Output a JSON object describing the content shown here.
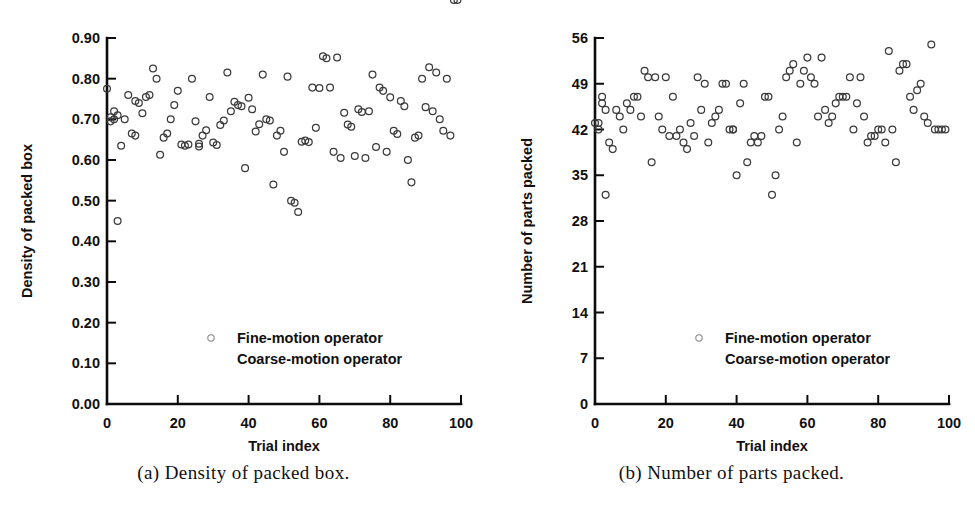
{
  "figure": {
    "background": "#ffffff",
    "marker_color": "#3b3b3b",
    "axis_color": "#0c0c0c"
  },
  "panels": [
    {
      "id": "a",
      "caption": "(a) Density of packed box.",
      "legend": {
        "entries": [
          {
            "label": "Fine-motion operator",
            "marker": "open-circle"
          },
          {
            "label": "Coarse-motion operator",
            "marker": "none"
          }
        ]
      },
      "chart_data": {
        "type": "scatter",
        "title": "",
        "xlabel": "Trial index",
        "ylabel": "Density of packed box",
        "xlim": [
          0,
          100
        ],
        "ylim": [
          0,
          0.9
        ],
        "xticks": [
          0,
          20,
          40,
          60,
          80,
          100
        ],
        "xticklabels": [
          "0",
          "20",
          "40",
          "60",
          "80",
          "100"
        ],
        "yticks": [
          0.0,
          0.1,
          0.2,
          0.3,
          0.4,
          0.5,
          0.6,
          0.7,
          0.8,
          0.9
        ],
        "yticklabels": [
          "0.00",
          "0.10",
          "0.20",
          "0.30",
          "0.40",
          "0.50",
          "0.60",
          "0.70",
          "0.80",
          "0.90"
        ],
        "grid": false,
        "legend_position": "lower-center",
        "series": [
          {
            "name": "Fine-motion operator",
            "marker": "open-circle",
            "x": [
              0,
              1,
              1,
              2,
              2,
              3,
              3,
              4,
              5,
              6,
              7,
              8,
              8,
              9,
              10,
              11,
              12,
              13,
              14,
              15,
              16,
              17,
              18,
              19,
              20,
              21,
              22,
              23,
              24,
              25,
              26,
              26,
              27,
              28,
              29,
              30,
              31,
              32,
              33,
              34,
              35,
              36,
              37,
              38,
              39,
              40,
              41,
              42,
              43,
              44,
              45,
              46,
              47,
              48,
              49,
              50,
              51,
              52,
              53,
              54,
              55,
              56,
              57,
              58,
              59,
              60,
              61,
              62,
              63,
              64,
              65,
              66,
              67,
              68,
              69,
              70,
              71,
              72,
              73,
              74,
              75,
              76,
              77,
              78,
              79,
              80,
              81,
              82,
              83,
              84,
              85,
              86,
              87,
              88,
              89,
              90,
              91,
              92,
              93,
              94,
              95,
              96,
              97,
              98,
              99
            ],
            "y": [
              0.775,
              0.705,
              0.695,
              0.72,
              0.7,
              0.71,
              0.45,
              0.635,
              0.7,
              0.76,
              0.665,
              0.66,
              0.745,
              0.74,
              0.715,
              0.755,
              0.76,
              0.825,
              0.8,
              0.613,
              0.655,
              0.665,
              0.7,
              0.735,
              0.77,
              0.638,
              0.635,
              0.638,
              0.8,
              0.695,
              0.633,
              0.64,
              0.66,
              0.673,
              0.755,
              0.643,
              0.637,
              0.686,
              0.697,
              0.815,
              0.72,
              0.743,
              0.735,
              0.732,
              0.58,
              0.753,
              0.725,
              0.67,
              0.688,
              0.81,
              0.7,
              0.697,
              0.54,
              0.66,
              0.672,
              0.62,
              0.805,
              0.5,
              0.495,
              0.472,
              0.645,
              0.648,
              0.644,
              0.778,
              0.679,
              0.777,
              0.855,
              0.85,
              0.778,
              0.62,
              0.852,
              0.605,
              0.716,
              0.687,
              0.682,
              0.61,
              0.725,
              0.718,
              0.605,
              0.72,
              0.81,
              0.632,
              0.778,
              0.77,
              0.62,
              0.754,
              0.672,
              0.664,
              0.745,
              0.732,
              0.6,
              0.545,
              0.655,
              0.66,
              0.8,
              0.73,
              0.828,
              0.72,
              0.815,
              0.7,
              0.672,
              0.8,
              0.66
            ]
          }
        ]
      }
    },
    {
      "id": "b",
      "caption": "(b) Number of parts packed.",
      "legend": {
        "entries": [
          {
            "label": "Fine-motion operator",
            "marker": "open-circle"
          },
          {
            "label": "Coarse-motion operator",
            "marker": "none"
          }
        ]
      },
      "chart_data": {
        "type": "scatter",
        "title": "",
        "xlabel": "Trial index",
        "ylabel": "Number of parts packed",
        "xlim": [
          0,
          100
        ],
        "ylim": [
          0,
          56
        ],
        "xticks": [
          0,
          20,
          40,
          60,
          80,
          100
        ],
        "xticklabels": [
          "0",
          "20",
          "40",
          "60",
          "80",
          "100"
        ],
        "yticks": [
          0,
          7,
          14,
          21,
          28,
          35,
          42,
          49,
          56
        ],
        "yticklabels": [
          "0",
          "7",
          "14",
          "21",
          "28",
          "35",
          "42",
          "49",
          "56"
        ],
        "grid": false,
        "legend_position": "lower-center",
        "series": [
          {
            "name": "Fine-motion operator",
            "marker": "open-circle",
            "x": [
              0,
              1,
              1,
              2,
              2,
              3,
              3,
              4,
              5,
              6,
              7,
              8,
              9,
              10,
              11,
              12,
              13,
              14,
              15,
              16,
              17,
              18,
              19,
              20,
              21,
              22,
              23,
              24,
              25,
              26,
              27,
              28,
              29,
              30,
              31,
              32,
              33,
              34,
              35,
              36,
              37,
              38,
              39,
              39,
              40,
              41,
              42,
              43,
              44,
              45,
              46,
              47,
              48,
              49,
              50,
              51,
              52,
              53,
              54,
              55,
              56,
              57,
              58,
              59,
              60,
              61,
              62,
              63,
              64,
              65,
              66,
              67,
              68,
              69,
              70,
              71,
              72,
              73,
              74,
              75,
              76,
              77,
              78,
              79,
              80,
              81,
              82,
              83,
              84,
              85,
              86,
              87,
              88,
              89,
              90,
              91,
              92,
              93,
              94,
              95,
              96,
              97,
              98,
              99
            ],
            "y": [
              43,
              43,
              42,
              47,
              46,
              45,
              32,
              40,
              39,
              45,
              44,
              42,
              46,
              45,
              47,
              47,
              44,
              51,
              50,
              37,
              50,
              44,
              42,
              50,
              41,
              47,
              41,
              42,
              40,
              39,
              43,
              41,
              50,
              45,
              49,
              40,
              43,
              44,
              45,
              49,
              49,
              42,
              42,
              42,
              35,
              46,
              49,
              37,
              40,
              41,
              40,
              41,
              47,
              47,
              32,
              35,
              42,
              44,
              50,
              51,
              52,
              40,
              49,
              51,
              53,
              50,
              49,
              44,
              53,
              45,
              43,
              44,
              46,
              47,
              47,
              47,
              50,
              42,
              46,
              50,
              44,
              40,
              41,
              41,
              42,
              42,
              40,
              54,
              42,
              37,
              51,
              52,
              52,
              47,
              45,
              48,
              49,
              44,
              43,
              55,
              42,
              42,
              42,
              42
            ]
          }
        ]
      }
    }
  ]
}
